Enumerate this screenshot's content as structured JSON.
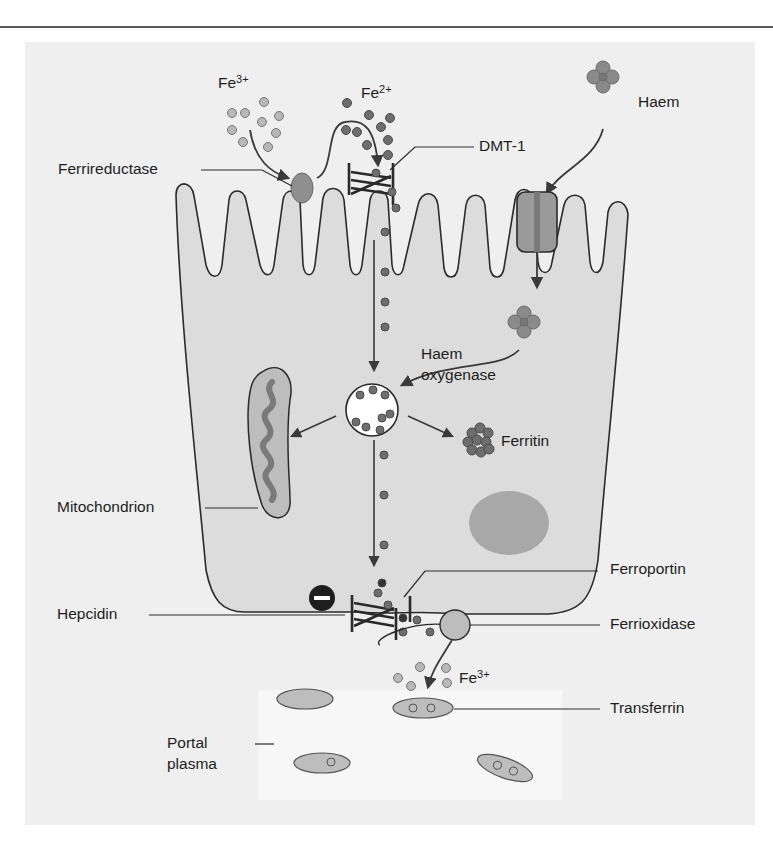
{
  "figure": {
    "labels": {
      "fe3_top": {
        "base": "Fe",
        "sup": "3+"
      },
      "fe2_top": {
        "base": "Fe",
        "sup": "2+"
      },
      "haem_top": "Haem",
      "ferrireductase": "Ferrireductase",
      "dmt1": "DMT-1",
      "haem_oxygenase_line1": "Haem",
      "haem_oxygenase_line2": "oxygenase",
      "ferritin": "Ferritin",
      "mitochondrion": "Mitochondrion",
      "ferroportin": "Ferroportin",
      "hepcidin": "Hepcidin",
      "hepcidin_effect": "−",
      "ferrioxidase": "Ferrioxidase",
      "fe3_bottom": {
        "base": "Fe",
        "sup": "3+"
      },
      "transferrin": "Transferrin",
      "portal_plasma_line1": "Portal",
      "portal_plasma_line2": "plasma"
    },
    "colors": {
      "background_panel": "#efefef",
      "cell_fill": "#dcdcdc",
      "plasma_fill": "#f7f7f7",
      "iron_dark": "#6e6e6e",
      "iron_light": "#b4b4b4",
      "stroke": "#2a2a2a",
      "nucleus": "#a8a8a8"
    }
  }
}
